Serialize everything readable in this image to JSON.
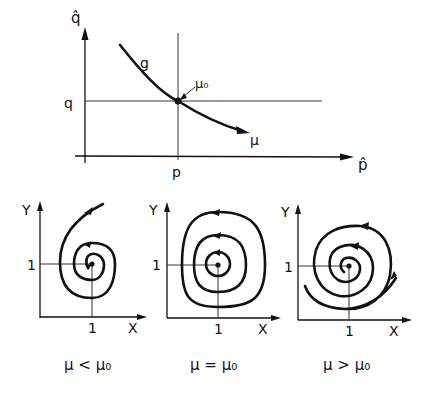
{
  "top_plot": {
    "y_axis_label": "q̂",
    "x_axis_label": "p̂",
    "q_tick_label": "q",
    "p_tick_label": "p",
    "curve_label": "g",
    "point_label": "μ₀",
    "direction_label": "μ"
  },
  "phase_portraits": [
    {
      "y_label": "Y",
      "x_label": "X",
      "y_tick": "1",
      "x_tick": "1",
      "caption": "μ < μ₀",
      "behavior": "stable spiral (inward)"
    },
    {
      "y_label": "Y",
      "x_label": "X",
      "y_tick": "1",
      "x_tick": "1",
      "caption": "μ = μ₀",
      "behavior": "closed orbits (center)"
    },
    {
      "y_label": "Y",
      "x_label": "X",
      "y_tick": "1",
      "x_tick": "1",
      "caption": "μ > μ₀",
      "behavior": "unstable spiral (outward)"
    }
  ]
}
